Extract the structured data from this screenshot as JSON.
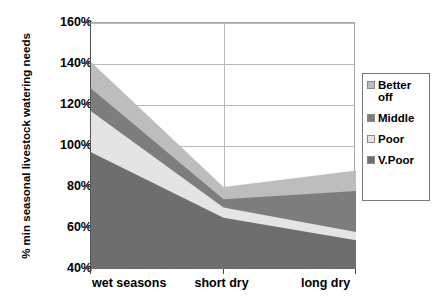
{
  "chart_data": {
    "type": "area",
    "stacked": true,
    "title": "",
    "xlabel": "",
    "ylabel": "% min seasonal livestock watering needs",
    "categories": [
      "wet seasons",
      "short dry",
      "long dry"
    ],
    "ylim": [
      40,
      160
    ],
    "ytick_labels": [
      "40%",
      "60%",
      "80%",
      "100%",
      "120%",
      "140%",
      "160%"
    ],
    "ytick_values": [
      40,
      60,
      80,
      100,
      120,
      140,
      160
    ],
    "grid": true,
    "legend_position": "right",
    "series": [
      {
        "name": "V.Poor",
        "values": [
          57,
          25,
          14
        ],
        "cumulative": [
          97,
          65,
          54
        ],
        "color": "#6e6e6e"
      },
      {
        "name": "Poor",
        "values": [
          20,
          5,
          4
        ],
        "cumulative": [
          117,
          70,
          58
        ],
        "color": "#e4e4e4"
      },
      {
        "name": "Middle",
        "values": [
          11,
          4,
          20
        ],
        "cumulative": [
          128,
          74,
          78
        ],
        "color": "#7d7d7d"
      },
      {
        "name": "Better off",
        "values": [
          13,
          6,
          10
        ],
        "cumulative": [
          141,
          80,
          88
        ],
        "color": "#bdbdbd"
      }
    ],
    "legend_entries": [
      {
        "label": "Better off",
        "color": "#bdbdbd"
      },
      {
        "label": "Middle",
        "color": "#7d7d7d"
      },
      {
        "label": "Poor",
        "color": "#e4e4e4"
      },
      {
        "label": "V.Poor",
        "color": "#6e6e6e"
      }
    ]
  }
}
